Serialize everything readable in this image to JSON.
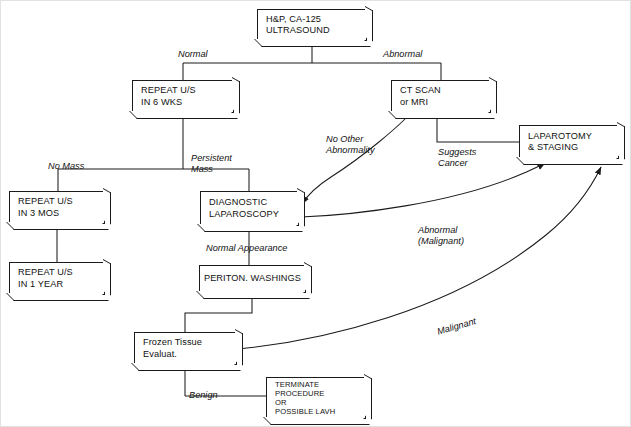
{
  "diagram": {
    "line_color": "#1b1b1b",
    "background": "#ffffff",
    "nodes": [
      {
        "id": "hp",
        "label": "H&P, CA-125\nULTRASOUND",
        "x": 256,
        "y": 8,
        "w": 110,
        "h": 32,
        "align": "left"
      },
      {
        "id": "repeat6",
        "label": "REPEAT U/S\nIN 6 WKS",
        "x": 131,
        "y": 79,
        "w": 102,
        "h": 33,
        "align": "left"
      },
      {
        "id": "ctscan",
        "label": "CT SCAN\nor MRI",
        "x": 390,
        "y": 79,
        "w": 100,
        "h": 33,
        "align": "left"
      },
      {
        "id": "laparotomy",
        "label": "LAPAROTOMY\n& STAGING",
        "x": 518,
        "y": 124,
        "w": 100,
        "h": 34,
        "align": "left"
      },
      {
        "id": "repeat3",
        "label": "REPEAT U/S\nIN 3 MOS",
        "x": 8,
        "y": 190,
        "w": 96,
        "h": 33,
        "align": "left"
      },
      {
        "id": "diaglap",
        "label": "DIAGNOSTIC\nLAPAROSCOPY",
        "x": 199,
        "y": 190,
        "w": 99,
        "h": 35,
        "align": "left"
      },
      {
        "id": "repeat1y",
        "label": "REPEAT U/S\nIN 1 YEAR",
        "x": 8,
        "y": 261,
        "w": 96,
        "h": 33,
        "align": "left"
      },
      {
        "id": "periton",
        "label": "PERITON. WASHINGS",
        "x": 198,
        "y": 264,
        "w": 107,
        "h": 28,
        "align": "center"
      },
      {
        "id": "frozen",
        "label": "Frozen Tissue\nEvaluat.",
        "x": 133,
        "y": 331,
        "w": 103,
        "h": 33,
        "align": "left"
      },
      {
        "id": "terminate",
        "label": "TERMINATE\nPROCEDURE\nOR\nPOSSIBLE LAVH",
        "x": 265,
        "y": 376,
        "w": 100,
        "h": 42,
        "align": "left"
      }
    ],
    "edge_labels": [
      {
        "id": "normal",
        "text": "Normal",
        "x": 177,
        "y": 48
      },
      {
        "id": "abnormal",
        "text": "Abnormal",
        "x": 382,
        "y": 48
      },
      {
        "id": "no-other",
        "text": "No Other\nAbnormality",
        "x": 325,
        "y": 133
      },
      {
        "id": "suggests",
        "text": "Suggests\nCancer",
        "x": 437,
        "y": 146
      },
      {
        "id": "no-mass",
        "text": "No Mass",
        "x": 47,
        "y": 160
      },
      {
        "id": "persistent",
        "text": "Persistent\nMass",
        "x": 190,
        "y": 152
      },
      {
        "id": "abn-malignant",
        "text": "Abnormal\n(Malignant)",
        "x": 417,
        "y": 224
      },
      {
        "id": "normal-appear",
        "text": "Normal Appearance",
        "x": 205,
        "y": 242
      },
      {
        "id": "malignant",
        "text": "Malignant",
        "x": 435,
        "y": 326
      },
      {
        "id": "benign",
        "text": "Benign",
        "x": 188,
        "y": 389
      }
    ]
  }
}
